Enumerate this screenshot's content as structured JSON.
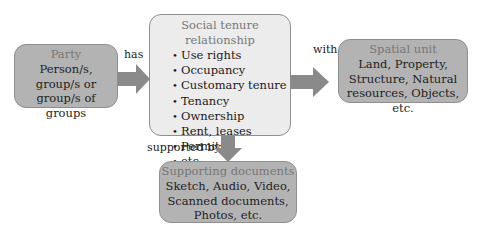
{
  "party": {
    "title": "Party",
    "lines": [
      "Person/s,",
      "group/s or",
      "group/s of groups"
    ]
  },
  "social_tenure": {
    "title": "Social tenure relationship",
    "items": [
      "Use rights",
      "Occupancy",
      "Customary tenure",
      "Tenancy",
      "Ownership",
      "Rent, leases",
      "Permits",
      "etc."
    ]
  },
  "spatial_unit": {
    "title": "Spatial unit",
    "lines": [
      "Land, Property,",
      "Structure, Natural",
      "resources, Objects, etc."
    ]
  },
  "supporting_documents": {
    "title": "Supporting documents",
    "lines": [
      "Sketch, Audio, Video,",
      "Scanned documents,",
      "Photos, etc."
    ]
  },
  "connectors": {
    "has": "has",
    "with": "with",
    "supported_by": "supported by"
  },
  "colors": {
    "dark_box": "#b3b3b3",
    "light_box": "#ececec",
    "arrow": "#8a8a8a",
    "title_text": "#777777"
  }
}
